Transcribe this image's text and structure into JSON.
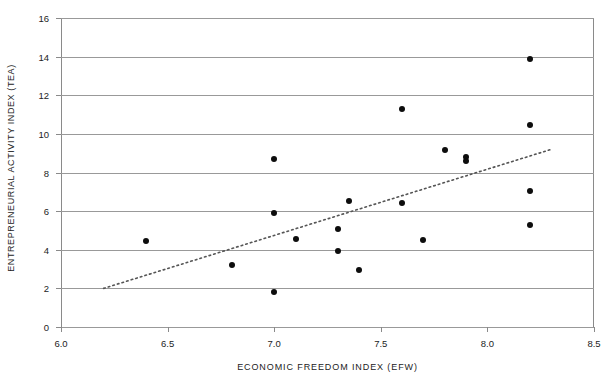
{
  "chart_data": {
    "type": "scatter",
    "title": "",
    "xlabel": "ECONOMIC FREEDOM INDEX (EFW)",
    "ylabel": "ENTREPRENEURIAL ACTIVITY INDEX (TEA)",
    "xlim": [
      6.0,
      8.5
    ],
    "ylim": [
      0,
      16
    ],
    "xticks": [
      "6.0",
      "6.5",
      "7.0",
      "7.5",
      "8.0",
      "8.5"
    ],
    "xtick_values": [
      6.0,
      6.5,
      7.0,
      7.5,
      8.0,
      8.5
    ],
    "yticks": [
      "0",
      "2",
      "4",
      "6",
      "8",
      "10",
      "12",
      "14",
      "16"
    ],
    "ytick_values": [
      0,
      2,
      4,
      6,
      8,
      10,
      12,
      14,
      16
    ],
    "grid": "horizontal",
    "legend": "none",
    "marker_color": "#0d0d0d",
    "grid_color": "#999999",
    "trendline_color": "#555555",
    "series": [
      {
        "name": "Countries",
        "x": [
          6.4,
          6.8,
          7.0,
          7.0,
          7.0,
          7.1,
          7.3,
          7.3,
          7.35,
          7.4,
          7.6,
          7.6,
          7.7,
          7.8,
          7.9,
          7.9,
          8.2,
          8.2,
          8.2,
          8.2
        ],
        "y": [
          4.45,
          3.2,
          8.7,
          5.9,
          1.8,
          4.55,
          5.1,
          3.95,
          6.55,
          2.95,
          11.3,
          6.4,
          4.5,
          9.15,
          8.8,
          8.6,
          13.9,
          10.45,
          7.05,
          5.3
        ]
      }
    ],
    "trendline": {
      "style": "dotted",
      "x_start": 6.2,
      "y_start": 2.0,
      "x_end": 8.3,
      "y_end": 9.2
    }
  }
}
